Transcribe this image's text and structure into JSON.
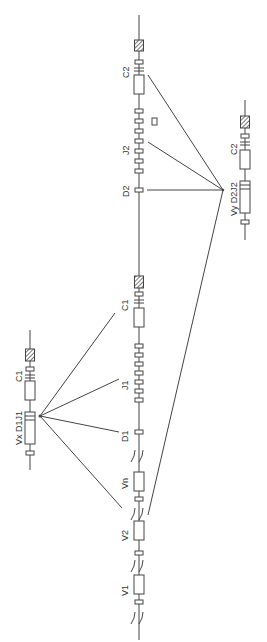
{
  "figure": {
    "colors": {
      "line": "#444444",
      "fill": "#ffffff",
      "hatch": "#555555"
    }
  },
  "main_locus": {
    "segments_bottom_to_top": [
      "break",
      "V1",
      "break",
      "V2",
      "break",
      "Vn",
      "break",
      "D1",
      "J1 cluster",
      "C1",
      "C1 hatched",
      "D2",
      "J2 cluster",
      "C2",
      "C2 hatched"
    ],
    "labels": {
      "v1": "V1",
      "v2": "V2",
      "vn": "Vn",
      "d1": "D1",
      "j1": "J1",
      "c1": "C1",
      "d2": "D2",
      "j2": "J2",
      "c2": "C2"
    }
  },
  "rearranged_left": {
    "label_vdj": "Vx D1J1",
    "label_c": "C1"
  },
  "rearranged_right": {
    "label_vdj": "Vy D2J2",
    "label_c": "C2"
  }
}
